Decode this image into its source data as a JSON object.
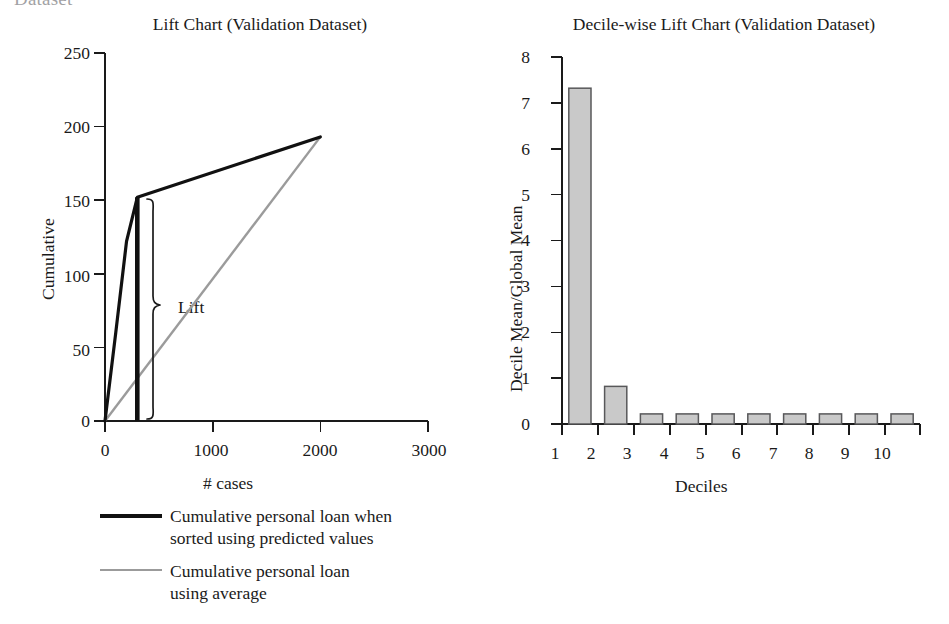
{
  "page": {
    "cut_off_heading": "Dataset",
    "background_color": "#ffffff"
  },
  "charts": {
    "lift": {
      "title": "Lift Chart (Validation Dataset)",
      "xlabel": "# cases",
      "ylabel": "Cumulative",
      "xticks": [
        "0",
        "1000",
        "2000",
        "3000"
      ],
      "yticks": [
        "0",
        "50",
        "100",
        "150",
        "200",
        "250"
      ],
      "annotation": "Lift",
      "series_colors": {
        "predicted": "#111111",
        "average": "#9b9b9b"
      }
    },
    "decile": {
      "title": "Decile-wise Lift Chart (Validation Dataset)",
      "xlabel": "Deciles",
      "ylabel": "Decile Mean/Global Mean",
      "xticks": [
        "1",
        "2",
        "3",
        "4",
        "5",
        "6",
        "7",
        "8",
        "9",
        "10"
      ],
      "yticks": [
        "0",
        "1",
        "2",
        "3",
        "4",
        "5",
        "6",
        "7",
        "8"
      ],
      "bar_fill": "#c9c9c9",
      "bar_stroke": "#58585a"
    }
  },
  "legend": {
    "items": [
      {
        "style": "thick",
        "color": "#111111",
        "label": "Cumulative personal loan when\nsorted using predicted values"
      },
      {
        "style": "thin",
        "color": "#9b9b9b",
        "label": "Cumulative personal loan\nusing average"
      }
    ]
  },
  "chart_data": [
    {
      "type": "line",
      "title": "Lift Chart (Validation Dataset)",
      "xlabel": "# cases",
      "ylabel": "Cumulative",
      "xlim": [
        0,
        3000
      ],
      "ylim": [
        0,
        250
      ],
      "xticks": [
        0,
        1000,
        2000,
        3000
      ],
      "yticks": [
        0,
        50,
        100,
        150,
        200,
        250
      ],
      "grid": false,
      "legend_position": "below-left",
      "annotations": [
        {
          "text": "Lift",
          "x": 600,
          "y": 75,
          "note": "curly brace spans vertical gap between the two curves at approx. 300 cases"
        }
      ],
      "series": [
        {
          "name": "Cumulative personal loan when sorted using predicted values",
          "color": "#111111",
          "x": [
            0,
            100,
            200,
            300,
            2000
          ],
          "values": [
            0,
            60,
            122,
            152,
            193
          ]
        },
        {
          "name": "Cumulative personal loan using average",
          "color": "#9b9b9b",
          "x": [
            0,
            2000
          ],
          "values": [
            0,
            193
          ]
        }
      ],
      "reference_marker": {
        "type": "vertical-line",
        "x": 300,
        "y_from": 0,
        "y_to": 152,
        "color": "#111111"
      }
    },
    {
      "type": "bar",
      "title": "Decile-wise Lift Chart (Validation Dataset)",
      "xlabel": "Deciles",
      "ylabel": "Decile Mean/Global Mean",
      "categories": [
        "1",
        "2",
        "3",
        "4",
        "5",
        "6",
        "7",
        "8",
        "9",
        "10"
      ],
      "values": [
        7.32,
        0.82,
        0.22,
        0.22,
        0.22,
        0.22,
        0.22,
        0.22,
        0.22,
        0.22
      ],
      "ylim": [
        0,
        8
      ],
      "yticks": [
        0,
        1,
        2,
        3,
        4,
        5,
        6,
        7,
        8
      ],
      "grid": false,
      "bar_fill": "#c9c9c9",
      "bar_stroke": "#58585a"
    }
  ]
}
